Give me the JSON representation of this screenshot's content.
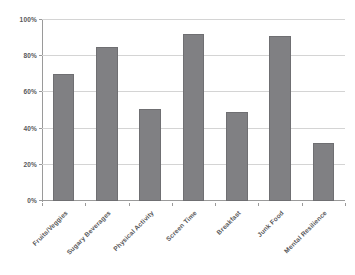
{
  "chart_data": {
    "type": "bar",
    "title": "",
    "subtitle": "",
    "xlabel": "",
    "ylabel": "",
    "categories": [
      "Fruits/Veggies",
      "Sugary Beverages",
      "Physical Activity",
      "Screen Time",
      "Breakfast",
      "Junk Food",
      "Mental Resilience"
    ],
    "values": [
      70,
      85,
      51,
      92,
      49,
      91,
      32
    ],
    "ylim": [
      0,
      100
    ],
    "ytick_values": [
      0,
      20,
      40,
      60,
      80,
      100
    ],
    "ytick_labels": [
      "0%",
      "20%",
      "40%",
      "60%",
      "80%",
      "100%"
    ],
    "grid": "horizontal",
    "legend": "none",
    "series": [
      {
        "name": "",
        "values": [
          70,
          85,
          51,
          92,
          49,
          91,
          32
        ]
      }
    ],
    "annotations": []
  },
  "style": {
    "bar_color": "#808083",
    "bar_border_color": "#6f6f72",
    "gridline_color": "#d4d4d4",
    "axis_color": "#9a9a9a",
    "text_color": "#58585a",
    "background": "#ffffff"
  }
}
